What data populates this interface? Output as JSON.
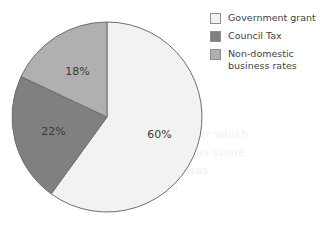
{
  "chart_data": {
    "type": "pie",
    "title": "",
    "subtitle": "",
    "xlabel": "",
    "ylabel": "",
    "legend_position": "right",
    "grid": false,
    "start_angle_deg": 0,
    "direction": "clockwise",
    "units": "percent",
    "categories": [
      "Government grant",
      "Council Tax",
      "Non-domestic business rates"
    ],
    "values": [
      60,
      22,
      18
    ],
    "data_labels": [
      "60%",
      "22%",
      "18%"
    ],
    "colors": [
      "#f2f2f0",
      "#808080",
      "#b0b0b0"
    ],
    "slices": [
      {
        "label": "Government grant",
        "value": 60,
        "data_label": "60%",
        "color": "#f2f2f0",
        "start_deg": 0,
        "end_deg": 216
      },
      {
        "label": "Council Tax",
        "value": 22,
        "data_label": "22%",
        "color": "#808080",
        "start_deg": 216,
        "end_deg": 295.2
      },
      {
        "label": "Non-domestic business rates",
        "value": 18,
        "data_label": "18%",
        "color": "#b0b0b0",
        "start_deg": 295.2,
        "end_deg": 360
      }
    ]
  },
  "legend": {
    "items": [
      {
        "label": "Government grant",
        "color": "#f2f2f0"
      },
      {
        "label": "Council Tax",
        "color": "#808080"
      },
      {
        "label": "Non-domestic\nbusiness rates",
        "color": "#b0b0b0"
      }
    ]
  },
  "slice_labels": {
    "government_grant": "60%",
    "council_tax": "22%",
    "non_domestic": "18%"
  },
  "style": {
    "outline_color": "#6e6e6e",
    "label_color": "#3a3a3a",
    "background": "#ffffff"
  },
  "background_bleed": {
    "lines": [
      "resources over which",
      "the council has some",
      "discretion was",
      "half their"
    ]
  }
}
